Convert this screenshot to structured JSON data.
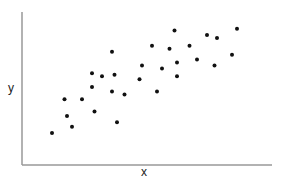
{
  "chart_data": {
    "type": "scatter",
    "title": "",
    "xlabel": "x",
    "ylabel": "y",
    "xlim": [
      0,
      10
    ],
    "ylim": [
      0,
      10
    ],
    "grid": false,
    "legend": null,
    "ticks": "none",
    "point_color": "#111111",
    "axis_color": "#999999",
    "points": [
      {
        "x": 1.2,
        "y": 2.1
      },
      {
        "x": 1.7,
        "y": 4.3
      },
      {
        "x": 2.0,
        "y": 2.5
      },
      {
        "x": 1.8,
        "y": 3.2
      },
      {
        "x": 2.4,
        "y": 4.3
      },
      {
        "x": 2.8,
        "y": 5.1
      },
      {
        "x": 2.8,
        "y": 6.0
      },
      {
        "x": 3.2,
        "y": 5.8
      },
      {
        "x": 3.6,
        "y": 7.4
      },
      {
        "x": 3.7,
        "y": 5.9
      },
      {
        "x": 3.6,
        "y": 4.8
      },
      {
        "x": 4.1,
        "y": 4.6
      },
      {
        "x": 2.9,
        "y": 3.5
      },
      {
        "x": 3.8,
        "y": 2.8
      },
      {
        "x": 5.4,
        "y": 4.8
      },
      {
        "x": 4.7,
        "y": 5.6
      },
      {
        "x": 4.8,
        "y": 6.5
      },
      {
        "x": 5.6,
        "y": 6.3
      },
      {
        "x": 6.2,
        "y": 5.8
      },
      {
        "x": 6.2,
        "y": 6.7
      },
      {
        "x": 5.2,
        "y": 7.8
      },
      {
        "x": 5.9,
        "y": 7.6
      },
      {
        "x": 6.1,
        "y": 8.8
      },
      {
        "x": 6.7,
        "y": 7.8
      },
      {
        "x": 7.0,
        "y": 6.9
      },
      {
        "x": 7.4,
        "y": 8.5
      },
      {
        "x": 7.8,
        "y": 8.3
      },
      {
        "x": 7.7,
        "y": 6.5
      },
      {
        "x": 8.4,
        "y": 7.2
      },
      {
        "x": 8.6,
        "y": 8.9
      }
    ]
  },
  "labels": {
    "x": "x",
    "y": "y"
  }
}
